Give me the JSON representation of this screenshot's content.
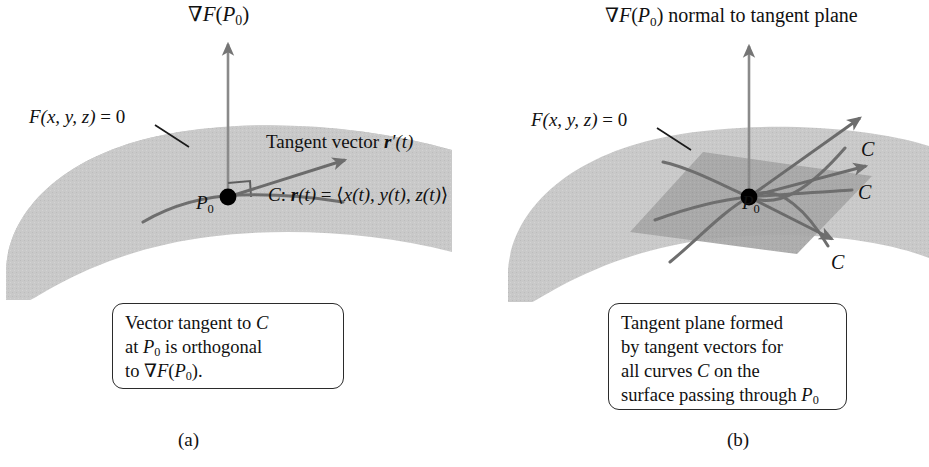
{
  "figure": {
    "colors": {
      "surface_light": "#c9c9c9",
      "surface_mid": "#bdbdbd",
      "tangent_plane": "#a6a6a6",
      "curve_stroke": "#6e6e6e",
      "vector_stroke": "#6b6b6b",
      "axis_stroke": "#8a8a8a",
      "point_fill": "#000000",
      "text": "#111111",
      "box_border": "#2b2b2b",
      "background": "#ffffff"
    }
  },
  "panel_a": {
    "gradient_label": {
      "nabla": "∇",
      "F": "F",
      "open": "(",
      "P": "P",
      "sub": "0",
      "close": ")"
    },
    "surface_label": {
      "F": "F",
      "args": "(x, y, z)",
      "equals": " = 0"
    },
    "tangent_vector_label": {
      "prefix": "Tangent vector ",
      "r": "r",
      "prime": "′",
      "arg": "(t)"
    },
    "curve_param_label": {
      "curve": "C",
      "colon": ": ",
      "r": "r",
      "arg": "(t)",
      "equals": " = ",
      "open_angle": "⟨",
      "components": "x(t), y(t), z(t)",
      "close_angle": "⟩"
    },
    "point_label": {
      "P": "P",
      "sub": "0"
    },
    "right_angle_marker": "right-angle",
    "caption": {
      "line1_pre": "Vector tangent to ",
      "line1_math": "C",
      "line2_pre": "at ",
      "line2_P": "P",
      "line2_sub": "0",
      "line2_post": " is orthogonal",
      "line3_pre": "to ",
      "line3_nabla": "∇",
      "line3_F": "F",
      "line3_open": "(",
      "line3_P": "P",
      "line3_sub": "0",
      "line3_close": ").",
      "full_text": "Vector tangent to C at P0 is orthogonal to ∇F(P0)."
    },
    "subcaption": "(a)"
  },
  "panel_b": {
    "gradient_label": {
      "nabla": "∇",
      "F": "F",
      "open": "(",
      "P": "P",
      "sub": "0",
      "close": ")",
      "text": " normal to tangent plane"
    },
    "surface_label": {
      "F": "F",
      "args": "(x, y, z)",
      "equals": " = 0"
    },
    "point_label": {
      "P": "P",
      "sub": "0"
    },
    "curve_labels": [
      "C",
      "C",
      "C"
    ],
    "caption": {
      "line1": "Tangent plane formed",
      "line2": "by tangent vectors for",
      "line3_pre": "all curves ",
      "line3_math": "C",
      "line3_post": " on the",
      "line4_pre": "surface passing through ",
      "line4_P": "P",
      "line4_sub": "0",
      "full_text": "Tangent plane formed by tangent vectors for all curves C on the surface passing through P0"
    },
    "subcaption": "(b)"
  }
}
